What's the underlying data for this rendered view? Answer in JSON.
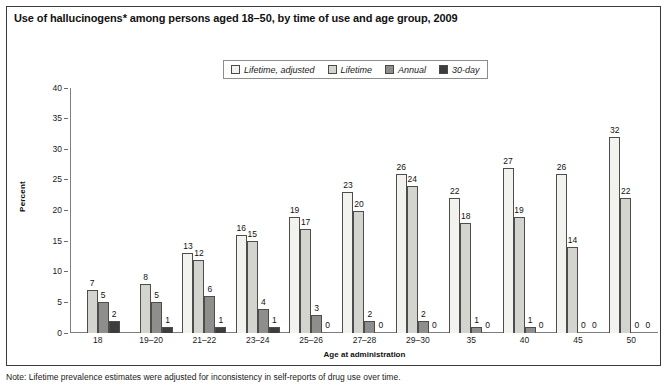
{
  "figure": {
    "title": "Use of hallucinogens* among persons aged 18–50, by time of use and age group, 2009",
    "footnote": "Note: Lifetime prevalence estimates were adjusted for inconsistency in self-reports of drug use over time."
  },
  "legend": {
    "items": [
      {
        "label": "Lifetime, adjusted",
        "color": "#f2f2ee"
      },
      {
        "label": "Lifetime",
        "color": "#d4d4cf"
      },
      {
        "label": "Annual",
        "color": "#8e8e8c"
      },
      {
        "label": "30-day",
        "color": "#3d3d3d"
      }
    ]
  },
  "axes": {
    "y_title": "Percent",
    "x_title": "Age at administration",
    "y_ticks": [
      "40",
      "35",
      "30",
      "25",
      "20",
      "15",
      "10",
      "5",
      "0"
    ]
  },
  "chart_data": {
    "type": "bar",
    "title": "Use of hallucinogens* among persons aged 18–50, by time of use and age group, 2009",
    "xlabel": "Age at administration",
    "ylabel": "Percent",
    "ylim": [
      0,
      40
    ],
    "ytick_step": 5,
    "grid": false,
    "legend_position": "top-center",
    "categories": [
      "18",
      "19–20",
      "21–22",
      "23–24",
      "25–26",
      "27–28",
      "29–30",
      "35",
      "40",
      "45",
      "50"
    ],
    "series": [
      {
        "name": "Lifetime, adjusted",
        "color": "#f2f2ee",
        "values": [
          null,
          null,
          13,
          16,
          19,
          23,
          26,
          22,
          27,
          26,
          32
        ]
      },
      {
        "name": "Lifetime",
        "color": "#d4d4cf",
        "values": [
          7,
          8,
          12,
          15,
          17,
          20,
          24,
          18,
          19,
          14,
          22
        ]
      },
      {
        "name": "Annual",
        "color": "#8e8e8c",
        "values": [
          5,
          5,
          6,
          4,
          3,
          2,
          2,
          1,
          1,
          0,
          0
        ]
      },
      {
        "name": "30-day",
        "color": "#3d3d3d",
        "values": [
          2,
          1,
          1,
          1,
          0,
          0,
          0,
          0,
          0,
          0,
          0
        ]
      }
    ]
  }
}
